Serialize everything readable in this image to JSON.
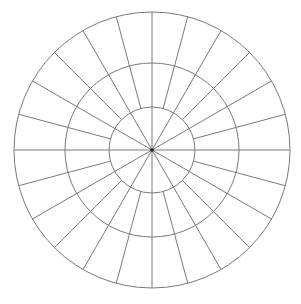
{
  "diagram": {
    "type": "polar-grid",
    "canvas": {
      "width": 301,
      "height": 304,
      "background": "#ffffff"
    },
    "center": {
      "x": 152,
      "y": 150
    },
    "rings": [
      {
        "name": "inner-ring",
        "radius": 43
      },
      {
        "name": "middle-ring",
        "radius": 87
      },
      {
        "name": "outer-ring",
        "radius": 138
      }
    ],
    "spokes": {
      "primary": {
        "count": 12,
        "step_deg": 30,
        "offset_deg": 0,
        "from_radius": 0,
        "to_radius": 138
      },
      "secondary": {
        "count": 12,
        "step_deg": 30,
        "offset_deg": 15,
        "from_radius": 43,
        "to_radius": 138
      }
    },
    "line_color": "#7a7a7a",
    "center_dot": {
      "radius": 1.8,
      "color": "#222222"
    }
  }
}
